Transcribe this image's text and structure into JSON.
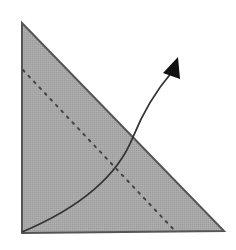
{
  "diagram": {
    "colors": {
      "background": "#ffffff",
      "triangle_fill": "#a6a6a6",
      "triangle_stroke": "#555555",
      "dotted_line": "#444444",
      "arrow": "#333333",
      "arrowhead": "#111111"
    },
    "triangle": {
      "apex": [
        22,
        23
      ],
      "right_angle_corner": [
        22,
        233
      ],
      "base_right": [
        224,
        231
      ]
    },
    "dotted_line": {
      "start": [
        23,
        70
      ],
      "end": [
        176,
        232
      ]
    },
    "arrow": {
      "start": [
        22,
        232
      ],
      "control": [
        110,
        195
      ],
      "crossing_point": [
        133,
        137
      ],
      "end": [
        172,
        72
      ],
      "tip": [
        178,
        57
      ]
    }
  }
}
